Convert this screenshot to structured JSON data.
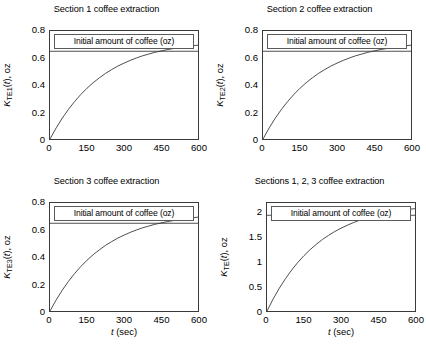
{
  "figure": {
    "background": "#ffffff",
    "line_color": "#3a3a3a",
    "axis_color": "#3a3a3a"
  },
  "panels": [
    {
      "title": "Section 1 coffee extraction",
      "legend_label": "Initial amount of coffee (oz)",
      "ylabel_prefix": "K",
      "ylabel_sub": "TE",
      "ylabel_sub2": "1",
      "ylabel_suffix": "(t), oz",
      "xlabel_var": "t",
      "xlabel_rest": " (sec)",
      "yticks": [
        "0",
        "0.2",
        "0.4",
        "0.6",
        "0.8"
      ],
      "xticks": [
        "0",
        "150",
        "300",
        "450",
        "600"
      ]
    },
    {
      "title": "Section 2 coffee extraction",
      "legend_label": "Initial amount of coffee (oz)",
      "ylabel_prefix": "K",
      "ylabel_sub": "TE",
      "ylabel_sub2": "2",
      "ylabel_suffix": "(t), oz",
      "xlabel_var": "",
      "xlabel_rest": "",
      "yticks": [
        "0",
        "0.2",
        "0.4",
        "0.6",
        "0.8"
      ],
      "xticks": [
        "0",
        "150",
        "300",
        "450",
        "600"
      ]
    },
    {
      "title": "Section 3 coffee extraction",
      "legend_label": "Initial amount of coffee (oz)",
      "ylabel_prefix": "K",
      "ylabel_sub": "TE",
      "ylabel_sub2": "3",
      "ylabel_suffix": "(t), oz",
      "xlabel_var": "t",
      "xlabel_rest": " (sec)",
      "yticks": [
        "0",
        "0.2",
        "0.4",
        "0.6",
        "0.8"
      ],
      "xticks": [
        "0",
        "150",
        "300",
        "450",
        "600"
      ]
    },
    {
      "title": "Sections 1, 2, 3 coffee extraction",
      "legend_label": "Initial amount of coffee (oz)",
      "ylabel_prefix": "K",
      "ylabel_sub": "TE",
      "ylabel_sub2": "",
      "ylabel_suffix": "(t), oz",
      "xlabel_var": "t",
      "xlabel_rest": " (sec)",
      "yticks": [
        "0",
        "0.5",
        "1",
        "1.5",
        "2"
      ],
      "xticks": [
        "0",
        "150",
        "300",
        "450",
        "600"
      ]
    }
  ],
  "chart_data": [
    {
      "type": "line",
      "title": "Section 1 coffee extraction",
      "xlabel": "t (sec)",
      "ylabel": "K_TE1(t), oz",
      "xlim": [
        0,
        600
      ],
      "ylim": [
        0,
        0.8
      ],
      "xticks": [
        0,
        150,
        300,
        450,
        600
      ],
      "yticks": [
        0,
        0.2,
        0.4,
        0.6,
        0.8
      ],
      "grid": false,
      "legend": "Initial amount of coffee (oz)",
      "legend_position": "top-inside",
      "series": [
        {
          "name": "K_TE1(t)",
          "model": "saturating_exponential",
          "asymptote": 0.65,
          "time_constant_sec": 185,
          "x": [
            0,
            25,
            50,
            75,
            100,
            125,
            150,
            175,
            200,
            225,
            250,
            275,
            300,
            325,
            350,
            375,
            400,
            425,
            450,
            475,
            500,
            525,
            550,
            575,
            600
          ],
          "values": [
            0.0,
            0.082,
            0.155,
            0.22,
            0.278,
            0.33,
            0.376,
            0.417,
            0.453,
            0.486,
            0.514,
            0.54,
            0.562,
            0.582,
            0.6,
            0.616,
            0.629,
            0.642,
            0.652,
            0.662,
            0.67,
            0.678,
            0.684,
            0.69,
            0.695
          ]
        },
        {
          "name": "Initial amount of coffee",
          "type": "hline",
          "value": 0.65
        }
      ]
    },
    {
      "type": "line",
      "title": "Section 2 coffee extraction",
      "xlabel": "",
      "ylabel": "K_TE2(t), oz",
      "xlim": [
        0,
        600
      ],
      "ylim": [
        0,
        0.8
      ],
      "xticks": [
        0,
        150,
        300,
        450,
        600
      ],
      "yticks": [
        0,
        0.2,
        0.4,
        0.6,
        0.8
      ],
      "grid": false,
      "legend": "Initial amount of coffee (oz)",
      "legend_position": "top-inside",
      "series": [
        {
          "name": "K_TE2(t)",
          "model": "saturating_exponential",
          "asymptote": 0.65,
          "time_constant_sec": 185,
          "x": [
            0,
            25,
            50,
            75,
            100,
            125,
            150,
            175,
            200,
            225,
            250,
            275,
            300,
            325,
            350,
            375,
            400,
            425,
            450,
            475,
            500,
            525,
            550,
            575,
            600
          ],
          "values": [
            0.0,
            0.082,
            0.155,
            0.22,
            0.278,
            0.33,
            0.376,
            0.417,
            0.453,
            0.486,
            0.514,
            0.54,
            0.562,
            0.582,
            0.6,
            0.616,
            0.629,
            0.642,
            0.652,
            0.662,
            0.67,
            0.678,
            0.684,
            0.69,
            0.695
          ]
        },
        {
          "name": "Initial amount of coffee",
          "type": "hline",
          "value": 0.65
        }
      ]
    },
    {
      "type": "line",
      "title": "Section 3 coffee extraction",
      "xlabel": "t (sec)",
      "ylabel": "K_TE3(t), oz",
      "xlim": [
        0,
        600
      ],
      "ylim": [
        0,
        0.8
      ],
      "xticks": [
        0,
        150,
        300,
        450,
        600
      ],
      "yticks": [
        0,
        0.2,
        0.4,
        0.6,
        0.8
      ],
      "grid": false,
      "legend": "Initial amount of coffee (oz)",
      "legend_position": "top-inside",
      "series": [
        {
          "name": "K_TE3(t)",
          "model": "saturating_exponential",
          "asymptote": 0.65,
          "time_constant_sec": 185,
          "x": [
            0,
            25,
            50,
            75,
            100,
            125,
            150,
            175,
            200,
            225,
            250,
            275,
            300,
            325,
            350,
            375,
            400,
            425,
            450,
            475,
            500,
            525,
            550,
            575,
            600
          ],
          "values": [
            0.0,
            0.082,
            0.155,
            0.22,
            0.278,
            0.33,
            0.376,
            0.417,
            0.453,
            0.486,
            0.514,
            0.54,
            0.562,
            0.582,
            0.6,
            0.616,
            0.629,
            0.642,
            0.652,
            0.662,
            0.67,
            0.678,
            0.684,
            0.69,
            0.695
          ]
        },
        {
          "name": "Initial amount of coffee",
          "type": "hline",
          "value": 0.65
        }
      ]
    },
    {
      "type": "line",
      "title": "Sections 1, 2, 3 coffee extraction",
      "xlabel": "t (sec)",
      "ylabel": "K_TE(t), oz",
      "xlim": [
        0,
        600
      ],
      "ylim": [
        0,
        2.2
      ],
      "xticks": [
        0,
        150,
        300,
        450,
        600
      ],
      "yticks": [
        0,
        0.5,
        1,
        1.5,
        2
      ],
      "grid": false,
      "legend": "Initial amount of coffee (oz)",
      "legend_position": "top-inside",
      "series": [
        {
          "name": "K_TE(t)",
          "model": "saturating_exponential",
          "asymptote": 1.95,
          "time_constant_sec": 185,
          "x": [
            0,
            25,
            50,
            75,
            100,
            125,
            150,
            175,
            200,
            225,
            250,
            275,
            300,
            325,
            350,
            375,
            400,
            425,
            450,
            475,
            500,
            525,
            550,
            575,
            600
          ],
          "values": [
            0.0,
            0.246,
            0.465,
            0.66,
            0.834,
            0.99,
            1.128,
            1.251,
            1.359,
            1.458,
            1.542,
            1.62,
            1.686,
            1.746,
            1.8,
            1.848,
            1.887,
            1.926,
            1.956,
            1.986,
            2.01,
            2.034,
            2.052,
            2.07,
            2.085
          ]
        },
        {
          "name": "Initial amount of coffee",
          "type": "hline",
          "value": 1.95
        }
      ]
    }
  ]
}
